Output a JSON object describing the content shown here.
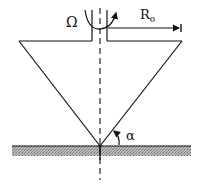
{
  "diagram": {
    "type": "cone-and-plate geometry",
    "labels": {
      "rotation": "Ω",
      "radius": "R",
      "radius_subscript": "o",
      "angle": "α"
    },
    "colors": {
      "line": "#111111",
      "hatch": "#9a9a9a",
      "background": "#ffffff"
    }
  }
}
